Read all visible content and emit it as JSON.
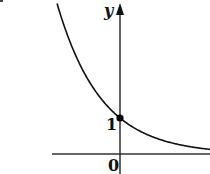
{
  "chart_data": {
    "type": "line",
    "title": "",
    "xlabel": "",
    "ylabel": "y",
    "function": "y = a^x with 0 < a < 1 (decaying exponential, e.g. e^-x)",
    "series": [
      {
        "name": "curve",
        "x": [
          -1.4,
          -1.0,
          -0.5,
          0,
          0.5,
          1.0,
          1.5,
          2.0
        ],
        "values": [
          4.06,
          2.72,
          1.65,
          1,
          0.61,
          0.37,
          0.22,
          0.14
        ]
      }
    ],
    "annotations": [
      {
        "type": "point",
        "x": 0,
        "y": 1,
        "label": "1",
        "filled": true
      },
      {
        "type": "origin_label",
        "label": "0"
      }
    ],
    "y_ticks": [
      "1"
    ],
    "x_ticks": [
      "0"
    ],
    "grid": false,
    "legend": null,
    "axis_color": "#222222",
    "curve_color": "#111111"
  },
  "labels": {
    "y_axis": "y",
    "y_intercept": "1",
    "origin": "0"
  }
}
